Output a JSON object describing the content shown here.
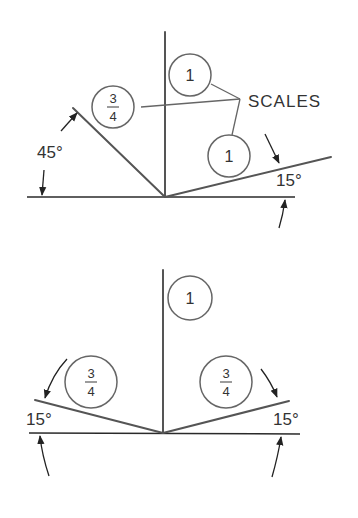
{
  "top_diagram": {
    "title": "Isometric-type axis arrangement",
    "angle_left_label": "45°",
    "angle_right_label": "15°",
    "scales_label": "SCALES",
    "scale_left": {
      "numerator": "3",
      "denominator": "4"
    },
    "scale_vertical": "1",
    "scale_right": "1"
  },
  "bottom_diagram": {
    "angle_left_label": "15°",
    "angle_right_label": "15°",
    "scale_vertical": "1",
    "scale_left": {
      "numerator": "3",
      "denominator": "4"
    },
    "scale_right": {
      "numerator": "3",
      "denominator": "4"
    }
  },
  "colors": {
    "line": "#555555",
    "baseline": "#2a2a2a",
    "text": "#333333",
    "background": "#ffffff"
  }
}
